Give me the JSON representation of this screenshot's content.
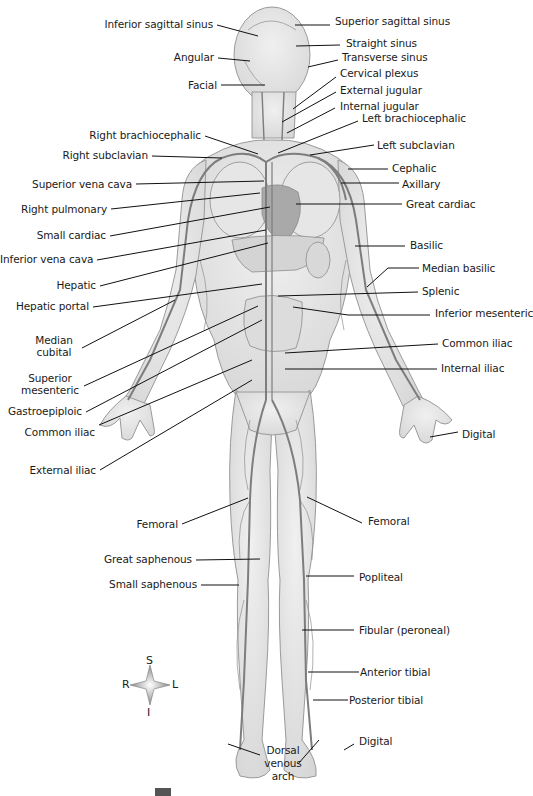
{
  "figure": {
    "colors": {
      "background": "#ffffff",
      "body_fill": "#e4e4e4",
      "body_stroke": "#9a9a9a",
      "vein": "#7d7d7d",
      "leader": "#111111",
      "text": "#1a1a1a"
    }
  },
  "labels_left": [
    {
      "id": "inferior-sagittal-sinus",
      "text": "Inferior sagittal sinus",
      "x": 20,
      "y": 18,
      "w": 228,
      "lx1": 217,
      "ly1": 25,
      "lx2": 258,
      "ly2": 36
    },
    {
      "id": "angular",
      "text": "Angular",
      "x": 140,
      "y": 51,
      "w": 108,
      "lx1": 218,
      "ly1": 58,
      "lx2": 250,
      "ly2": 61
    },
    {
      "id": "facial",
      "text": "Facial",
      "x": 160,
      "y": 79,
      "w": 88,
      "lx1": 221,
      "ly1": 85,
      "lx2": 265,
      "ly2": 85
    },
    {
      "id": "right-brachiocephalic",
      "text": "Right  brachiocephalic",
      "x": 60,
      "y": 129,
      "w": 147,
      "lx1": 205,
      "ly1": 136,
      "lx2": 258,
      "ly2": 154
    },
    {
      "id": "right-subclavian",
      "text": "Right subclavian",
      "x": 40,
      "y": 149,
      "w": 111,
      "lx1": 152,
      "ly1": 156,
      "lx2": 222,
      "ly2": 158
    },
    {
      "id": "superior-vena-cava",
      "text": "Superior vena cava",
      "x": 20,
      "y": 178,
      "w": 108,
      "lx1": 136,
      "ly1": 184,
      "lx2": 264,
      "ly2": 181
    },
    {
      "id": "right-pulmonary",
      "text": "Right pulmonary",
      "x": 20,
      "y": 203,
      "w": 86,
      "lx1": 111,
      "ly1": 209,
      "lx2": 260,
      "ly2": 193
    },
    {
      "id": "small-cardiac",
      "text": "Small cardiac",
      "x": 20,
      "y": 229,
      "w": 86,
      "lx1": 110,
      "ly1": 236,
      "lx2": 270,
      "ly2": 207
    },
    {
      "id": "inferior-vena-cava",
      "text": "Inferior vena cava",
      "x": 0,
      "y": 253,
      "w": 91,
      "lx1": 97,
      "ly1": 260,
      "lx2": 266,
      "ly2": 230
    },
    {
      "id": "hepatic",
      "text": "Hepatic",
      "x": 40,
      "y": 279,
      "w": 56,
      "lx1": 100,
      "ly1": 286,
      "lx2": 268,
      "ly2": 243
    },
    {
      "id": "hepatic-portal",
      "text": "Hepatic portal",
      "x": 10,
      "y": 300,
      "w": 80,
      "lx1": 93,
      "ly1": 307,
      "lx2": 262,
      "ly2": 284
    },
    {
      "id": "median-cubital",
      "text": "Median\ncubital",
      "x": 30,
      "y": 334,
      "w": 60,
      "lx1": 82,
      "ly1": 348,
      "lx2": 175,
      "ly2": 300,
      "multi": true
    },
    {
      "id": "superior-mesenteric",
      "text": "Superior\nmesenteric",
      "x": 20,
      "y": 372,
      "w": 60,
      "lx1": 84,
      "ly1": 386,
      "lx2": 258,
      "ly2": 306,
      "multi": true
    },
    {
      "id": "gastroepiploic",
      "text": "Gastroepiploic",
      "x": 5,
      "y": 405,
      "w": 80,
      "lx1": 86,
      "ly1": 412,
      "lx2": 262,
      "ly2": 320
    },
    {
      "id": "common-iliac-left",
      "text": "Common iliac",
      "x": 20,
      "y": 426,
      "w": 72,
      "lx1": 99,
      "ly1": 425,
      "lx2": 252,
      "ly2": 360
    },
    {
      "id": "external-iliac",
      "text": "External iliac",
      "x": 20,
      "y": 464,
      "w": 75,
      "lx1": 100,
      "ly1": 470,
      "lx2": 252,
      "ly2": 380
    },
    {
      "id": "femoral-left",
      "text": "Femoral",
      "x": 120,
      "y": 518,
      "w": 55,
      "lx1": 182,
      "ly1": 524,
      "lx2": 248,
      "ly2": 498
    },
    {
      "id": "great-saphenous",
      "text": "Great saphenous",
      "x": 90,
      "y": 553,
      "w": 105,
      "lx1": 196,
      "ly1": 560,
      "lx2": 260,
      "ly2": 559
    },
    {
      "id": "small-saphenous",
      "text": "Small saphenous",
      "x": 95,
      "y": 578,
      "w": 105,
      "lx1": 201,
      "ly1": 585,
      "lx2": 239,
      "ly2": 585
    }
  ],
  "labels_right": [
    {
      "id": "superior-sagittal-sinus",
      "text": "Superior sagittal sinus",
      "x": 335,
      "y": 15,
      "lx1": 295,
      "ly1": 25,
      "lx2": 330,
      "ly2": 25
    },
    {
      "id": "straight-sinus",
      "text": "Straight sinus",
      "x": 346,
      "y": 37,
      "lx1": 296,
      "ly1": 46,
      "lx2": 340,
      "ly2": 45
    },
    {
      "id": "transverse-sinus",
      "text": "Transverse sinus",
      "x": 342,
      "y": 51,
      "lx1": 308,
      "ly1": 67,
      "lx2": 338,
      "ly2": 60
    },
    {
      "id": "cervical-plexus",
      "text": "Cervical plexus",
      "x": 340,
      "y": 67,
      "lx1": 293,
      "ly1": 109,
      "lx2": 336,
      "ly2": 77
    },
    {
      "id": "external-jugular",
      "text": "External jugular",
      "x": 340,
      "y": 84,
      "lx1": 282,
      "ly1": 122,
      "lx2": 336,
      "ly2": 92
    },
    {
      "id": "internal-jugular",
      "text": "Internal jugular",
      "x": 340,
      "y": 100,
      "lx1": 287,
      "ly1": 133,
      "lx2": 335,
      "ly2": 108
    },
    {
      "id": "left-brachiocephalic",
      "text": "Left brachiocephalic",
      "x": 362,
      "y": 112,
      "lx1": 278,
      "ly1": 153,
      "lx2": 358,
      "ly2": 121
    },
    {
      "id": "left-subclavian",
      "text": "Left subclavian",
      "x": 377,
      "y": 139,
      "lx1": 310,
      "ly1": 155,
      "lx2": 374,
      "ly2": 145
    },
    {
      "id": "cephalic",
      "text": "Cephalic",
      "x": 392,
      "y": 162,
      "lx1": 348,
      "ly1": 169,
      "lx2": 388,
      "ly2": 169
    },
    {
      "id": "axillary",
      "text": "Axillary",
      "x": 402,
      "y": 178,
      "lx1": 341,
      "ly1": 183,
      "lx2": 399,
      "ly2": 183
    },
    {
      "id": "great-cardiac",
      "text": "Great cardiac",
      "x": 406,
      "y": 198,
      "lx1": 296,
      "ly1": 204,
      "lx2": 402,
      "ly2": 204
    },
    {
      "id": "basilic",
      "text": "Basilic",
      "x": 410,
      "y": 239,
      "lx1": 355,
      "ly1": 246,
      "lx2": 405,
      "ly2": 246
    },
    {
      "id": "median-basilic",
      "text": "Median basilic",
      "x": 422,
      "y": 262,
      "lx1": 367,
      "ly1": 287,
      "lx2": 398,
      "ly2": 267,
      "elbow": true
    },
    {
      "id": "splenic",
      "text": "Splenic",
      "x": 422,
      "y": 285,
      "lx1": 278,
      "ly1": 296,
      "lx2": 418,
      "ly2": 292
    },
    {
      "id": "inferior-mesenteric",
      "text": "Inferior mesenteric",
      "x": 435,
      "y": 307,
      "lx1": 293,
      "ly1": 307,
      "lx2": 430,
      "ly2": 315,
      "elbow2": true
    },
    {
      "id": "common-iliac-right",
      "text": "Common iliac",
      "x": 442,
      "y": 337,
      "lx1": 285,
      "ly1": 353,
      "lx2": 438,
      "ly2": 344
    },
    {
      "id": "internal-iliac",
      "text": "Internal iliac",
      "x": 441,
      "y": 362,
      "lx1": 285,
      "ly1": 369,
      "lx2": 437,
      "ly2": 369
    },
    {
      "id": "digital-hand",
      "text": "Digital",
      "x": 462,
      "y": 428,
      "lx1": 430,
      "ly1": 437,
      "lx2": 458,
      "ly2": 432
    },
    {
      "id": "femoral-right",
      "text": "Femoral",
      "x": 368,
      "y": 515,
      "lx1": 307,
      "ly1": 497,
      "lx2": 362,
      "ly2": 523
    },
    {
      "id": "popliteal",
      "text": "Popliteal",
      "x": 359,
      "y": 571,
      "lx1": 306,
      "ly1": 576,
      "lx2": 354,
      "ly2": 576
    },
    {
      "id": "fibular-peroneal",
      "text": "Fibular (peroneal)",
      "x": 359,
      "y": 624,
      "lx1": 302,
      "ly1": 630,
      "lx2": 354,
      "ly2": 630
    },
    {
      "id": "anterior-tibial",
      "text": "Anterior tibial",
      "x": 360,
      "y": 666,
      "lx1": 308,
      "ly1": 672,
      "lx2": 359,
      "ly2": 672
    },
    {
      "id": "posterior-tibial",
      "text": "Posterior tibial",
      "x": 349,
      "y": 694,
      "lx1": 313,
      "ly1": 700,
      "lx2": 348,
      "ly2": 700
    },
    {
      "id": "digital-foot",
      "text": "Digital",
      "x": 359,
      "y": 735,
      "lx1": 344,
      "ly1": 750,
      "lx2": 354,
      "ly2": 744
    }
  ],
  "label_bottom": {
    "id": "dorsal-venous-arch",
    "text": "Dorsal\nvenous\narch",
    "x": 252,
    "y": 744,
    "leaders": [
      {
        "x1": 260,
        "y1": 755,
        "x2": 228,
        "y2": 744
      },
      {
        "x1": 298,
        "y1": 764,
        "x2": 319,
        "y2": 740
      }
    ]
  },
  "compass": {
    "superior": "S",
    "inferior": "I",
    "right": "R",
    "left": "L",
    "cx": 150,
    "cy": 685
  }
}
